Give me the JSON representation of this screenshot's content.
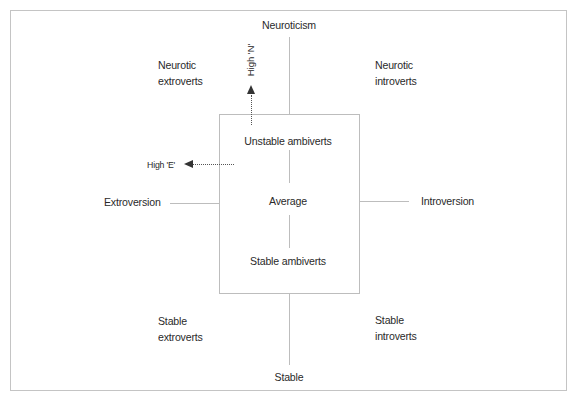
{
  "diagram": {
    "axes": {
      "top": "Neuroticism",
      "bottom": "Stable",
      "left": "Extroversion",
      "right": "Introversion"
    },
    "quadrants": {
      "top_left": [
        "Neurotic",
        "extroverts"
      ],
      "top_right": [
        "Neurotic",
        "introverts"
      ],
      "bottom_left": [
        "Stable",
        "extroverts"
      ],
      "bottom_right": [
        "Stable",
        "introverts"
      ]
    },
    "center_box": {
      "top": "Unstable ambiverts",
      "middle": "Average",
      "bottom": "Stable ambiverts"
    },
    "arrows": {
      "high_n": "High 'N'",
      "high_e": "High 'E'"
    },
    "colors": {
      "line": "#bdbdbd",
      "text": "#2a2a2a",
      "arrow": "#333333"
    }
  }
}
